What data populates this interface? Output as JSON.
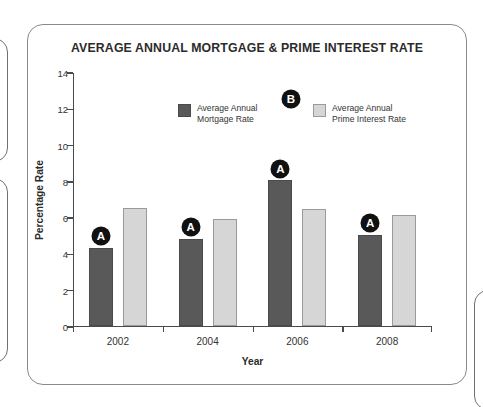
{
  "chart_data": {
    "type": "bar",
    "title": "AVERAGE ANNUAL MORTGAGE &  PRIME INTEREST RATE",
    "xlabel": "Year",
    "ylabel": "Percentage Rate",
    "categories": [
      "2002",
      "2004",
      "2006",
      "2008"
    ],
    "series": [
      {
        "name": "Average Annual\nMortgage Rate",
        "color": "#595959",
        "values": [
          4.3,
          4.8,
          8.0,
          5.0
        ]
      },
      {
        "name": "Average Annual\nPrime Interest Rate",
        "color": "#d6d6d6",
        "values": [
          6.5,
          5.9,
          6.45,
          6.1
        ]
      }
    ],
    "ylim": [
      0,
      14
    ],
    "yticks": [
      0,
      2,
      4,
      6,
      8,
      10,
      12,
      14
    ],
    "ytick_labels": [
      "0",
      "2",
      "4",
      "6",
      "8",
      "10",
      "12",
      "14"
    ],
    "grid": false,
    "legend_position": "inside-top-center",
    "annotations": [
      {
        "label": "A",
        "target": "bar",
        "category": "2002",
        "series": 0
      },
      {
        "label": "A",
        "target": "bar",
        "category": "2004",
        "series": 0
      },
      {
        "label": "A",
        "target": "bar",
        "category": "2006",
        "series": 0
      },
      {
        "label": "A",
        "target": "bar",
        "category": "2008",
        "series": 0
      },
      {
        "label": "B",
        "target": "legend"
      }
    ]
  },
  "annotation_badges": {
    "a_label": "A",
    "b_label": "B"
  }
}
